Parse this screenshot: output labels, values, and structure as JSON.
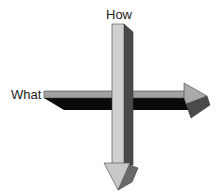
{
  "diagram": {
    "labels": {
      "how": "How",
      "what": "What"
    },
    "arrows": [
      {
        "name": "what-arrow",
        "direction": "right"
      },
      {
        "name": "how-arrow",
        "direction": "down"
      }
    ],
    "colors": {
      "light_face": "#a9a9a9",
      "pale_face": "#d0d0d0",
      "dark_side": "#4a4a4a",
      "black_side": "#0a0a0a",
      "outline": "#333333"
    }
  }
}
